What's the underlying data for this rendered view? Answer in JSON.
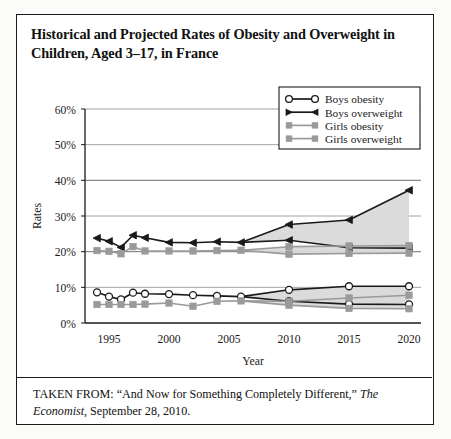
{
  "title": "Historical and Projected Rates of Obesity and Overweight in Children, Aged 3–17, in France",
  "caption": {
    "prefix": "TAKEN FROM: “And Now for Something Completely Different,” ",
    "source": "The Economist",
    "suffix": ", September 28, 2010."
  },
  "colors": {
    "boys": "#1a1a1a",
    "girls": "#9a9a9a",
    "band": "#d9d9d9",
    "axis": "#1a1a1a",
    "grid": "#8c8c8c",
    "frame": "#1a1a1a"
  },
  "chart_data": {
    "type": "line",
    "title": "Historical and Projected Rates of Obesity and Overweight in Children, Aged 3–17, in France",
    "xlabel": "Year",
    "ylabel": "Rates",
    "xlim": [
      1993,
      2021
    ],
    "ylim": [
      0,
      60
    ],
    "yticks": [
      0,
      10,
      20,
      30,
      40,
      50,
      60
    ],
    "ytick_labels": [
      "0%",
      "10%",
      "20%",
      "30%",
      "40%",
      "50%",
      "60%"
    ],
    "xticks": [
      1995,
      2000,
      2005,
      2010,
      2015,
      2020
    ],
    "xtick_labels": [
      "1995",
      "2000",
      "2005",
      "2010",
      "2015",
      "2020"
    ],
    "grid": "horizontal",
    "legend_position": "top-right",
    "projection_start": 2005,
    "legend": [
      {
        "label": "Boys obesity",
        "marker": "open-circle",
        "color": "#1a1a1a"
      },
      {
        "label": "Boys overweight",
        "marker": "filled-triangle",
        "color": "#1a1a1a"
      },
      {
        "label": "Girls obesity",
        "marker": "filled-square",
        "color": "#9a9a9a"
      },
      {
        "label": "Girls overweight",
        "marker": "filled-square",
        "color": "#9a9a9a"
      }
    ],
    "series": [
      {
        "name": "Boys overweight",
        "marker": "filled-triangle",
        "color": "#1a1a1a",
        "historical": [
          {
            "x": 1994,
            "y": 23.8
          },
          {
            "x": 1995,
            "y": 22.9
          },
          {
            "x": 1996,
            "y": 21.2
          },
          {
            "x": 1997,
            "y": 24.6
          },
          {
            "x": 1998,
            "y": 23.9
          },
          {
            "x": 2000,
            "y": 22.6
          },
          {
            "x": 2002,
            "y": 22.5
          },
          {
            "x": 2004,
            "y": 22.8
          },
          {
            "x": 2006,
            "y": 22.6
          }
        ],
        "projection_upper": [
          {
            "x": 2006,
            "y": 22.6
          },
          {
            "x": 2010,
            "y": 27.6
          },
          {
            "x": 2015,
            "y": 28.9
          },
          {
            "x": 2020,
            "y": 37.2
          }
        ],
        "projection_lower": [
          {
            "x": 2006,
            "y": 22.6
          },
          {
            "x": 2010,
            "y": 23.2
          },
          {
            "x": 2015,
            "y": 21.1
          },
          {
            "x": 2020,
            "y": 21.0
          }
        ]
      },
      {
        "name": "Girls overweight",
        "marker": "filled-square",
        "color": "#9a9a9a",
        "historical": [
          {
            "x": 1994,
            "y": 20.3
          },
          {
            "x": 1995,
            "y": 20.1
          },
          {
            "x": 1996,
            "y": 19.4
          },
          {
            "x": 1997,
            "y": 21.4
          },
          {
            "x": 1998,
            "y": 20.2
          },
          {
            "x": 2000,
            "y": 20.2
          },
          {
            "x": 2002,
            "y": 20.2
          },
          {
            "x": 2004,
            "y": 20.3
          },
          {
            "x": 2006,
            "y": 20.4
          }
        ],
        "projection_upper": [
          {
            "x": 2006,
            "y": 20.4
          },
          {
            "x": 2010,
            "y": 21.4
          },
          {
            "x": 2015,
            "y": 21.6
          },
          {
            "x": 2020,
            "y": 21.7
          }
        ],
        "projection_lower": [
          {
            "x": 2006,
            "y": 20.4
          },
          {
            "x": 2010,
            "y": 19.3
          },
          {
            "x": 2015,
            "y": 19.5
          },
          {
            "x": 2020,
            "y": 19.6
          }
        ]
      },
      {
        "name": "Boys obesity",
        "marker": "open-circle",
        "color": "#1a1a1a",
        "historical": [
          {
            "x": 1994,
            "y": 8.6
          },
          {
            "x": 1995,
            "y": 7.4
          },
          {
            "x": 1996,
            "y": 6.6
          },
          {
            "x": 1997,
            "y": 8.5
          },
          {
            "x": 1998,
            "y": 8.2
          },
          {
            "x": 2000,
            "y": 8.1
          },
          {
            "x": 2002,
            "y": 7.8
          },
          {
            "x": 2004,
            "y": 7.6
          },
          {
            "x": 2006,
            "y": 7.4
          }
        ],
        "projection_upper": [
          {
            "x": 2006,
            "y": 7.4
          },
          {
            "x": 2010,
            "y": 9.3
          },
          {
            "x": 2015,
            "y": 10.3
          },
          {
            "x": 2020,
            "y": 10.3
          }
        ],
        "projection_lower": [
          {
            "x": 2006,
            "y": 7.4
          },
          {
            "x": 2010,
            "y": 6.1
          },
          {
            "x": 2015,
            "y": 5.3
          },
          {
            "x": 2020,
            "y": 5.2
          }
        ]
      },
      {
        "name": "Girls obesity",
        "marker": "filled-square",
        "color": "#9a9a9a",
        "historical": [
          {
            "x": 1994,
            "y": 5.2
          },
          {
            "x": 1995,
            "y": 5.2
          },
          {
            "x": 1996,
            "y": 5.2
          },
          {
            "x": 1997,
            "y": 5.2
          },
          {
            "x": 1998,
            "y": 5.3
          },
          {
            "x": 2000,
            "y": 5.6
          },
          {
            "x": 2002,
            "y": 4.7
          },
          {
            "x": 2004,
            "y": 6.1
          },
          {
            "x": 2006,
            "y": 6.2
          }
        ],
        "projection_upper": [
          {
            "x": 2006,
            "y": 6.2
          },
          {
            "x": 2010,
            "y": 6.1
          },
          {
            "x": 2015,
            "y": 7.0
          },
          {
            "x": 2020,
            "y": 7.8
          }
        ],
        "projection_lower": [
          {
            "x": 2006,
            "y": 6.2
          },
          {
            "x": 2010,
            "y": 5.0
          },
          {
            "x": 2015,
            "y": 4.1
          },
          {
            "x": 2020,
            "y": 4.0
          }
        ]
      }
    ]
  }
}
